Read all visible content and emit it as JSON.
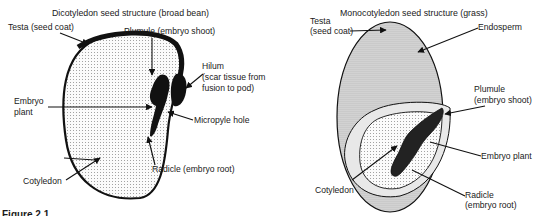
{
  "caption": "Figure 2.1",
  "dicot": {
    "title": "Dicotyledon seed structure (broad bean)",
    "labels": {
      "testa": "Testa (seed coat)",
      "plumule": "Plumule (embryo shoot)",
      "hilum_1": "Hilum",
      "hilum_2": "(scar tissue from",
      "hilum_3": "fusion to pod)",
      "embryo_1": "Embryo",
      "embryo_2": "plant",
      "micropyle": "Micropyle hole",
      "cotyledon": "Cotyledon",
      "radicle": "Radicle (embryo root)"
    }
  },
  "monocot": {
    "title": "Monocotyledon seed structure (grass)",
    "labels": {
      "testa_1": "Testa",
      "testa_2": "(seed coat)",
      "endosperm": "Endosperm",
      "plumule_1": "Plumule",
      "plumule_2": "(embryo shoot)",
      "embryo": "Embryo plant",
      "cotyledon": "Cotyledon",
      "radicle_1": "Radicle",
      "radicle_2": "(embryo root)"
    }
  },
  "colors": {
    "ink": "#111111",
    "dot_fill": "#f4f4f4",
    "endosperm_fill": "#d9d9d9"
  }
}
